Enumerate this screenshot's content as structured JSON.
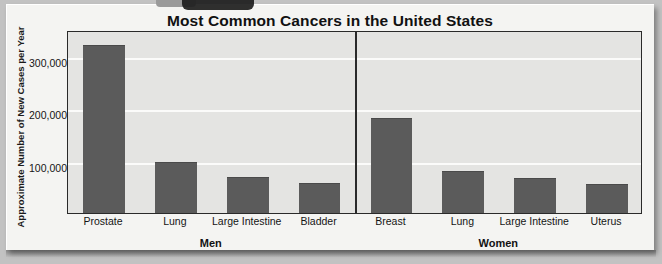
{
  "chart_data": {
    "type": "bar",
    "title": "Most Common Cancers in the United States",
    "xlabel": "",
    "ylabel": "Approximate Number of New Cases per Year",
    "ylim": [
      0,
      350000
    ],
    "yticks": [
      100000,
      200000,
      300000
    ],
    "ytick_labels": [
      "100,000",
      "200,000",
      "300,000"
    ],
    "grid": true,
    "legend": "none",
    "groups": [
      {
        "name": "Men",
        "categories": [
          "Prostate",
          "Lung",
          "Large Intestine",
          "Bladder"
        ],
        "values": [
          320000,
          95000,
          67000,
          55000
        ]
      },
      {
        "name": "Women",
        "categories": [
          "Breast",
          "Lung",
          "Large Intestine",
          "Uterus"
        ],
        "values": [
          180000,
          78000,
          66000,
          54000
        ]
      }
    ],
    "bar_color": "#5b5b5b",
    "plot_background": "#e4e4e2",
    "gridline_color": "#fbfbfa",
    "axis_color": "#2a2a2a"
  },
  "page": {
    "card_background": "#f4f4f2",
    "page_background": "#c2c2c2"
  }
}
